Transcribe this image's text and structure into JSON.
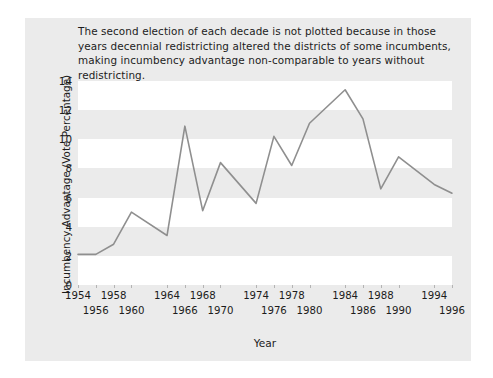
{
  "caption": "The second election of each decade is not plotted because in those years decennial redistricting altered the districts of some incumbents, making incumbency advantage non-comparable to years without redistricting.",
  "axis": {
    "ylabel": "Incumbency Advantage (Vote Percentage)",
    "xlabel": "Year"
  },
  "style": {
    "panel_background": "#ebebeb",
    "band_color": "#ffffff",
    "line_color": "#8f8f8f",
    "text_color": "#1c1c1c",
    "figure_background": "#ffffff"
  },
  "chart_data": {
    "type": "line",
    "title": "",
    "xlabel": "Year",
    "ylabel": "Incumbency Advantage (Vote Percentage)",
    "xlim": [
      1954,
      1996
    ],
    "ylim": [
      0,
      14
    ],
    "yticks": [
      0,
      2,
      4,
      6,
      8,
      10,
      12,
      14
    ],
    "xticks": [
      1954,
      1956,
      1958,
      1960,
      1964,
      1966,
      1968,
      1970,
      1974,
      1976,
      1978,
      1980,
      1984,
      1986,
      1988,
      1990,
      1994,
      1996
    ],
    "xticks_row0": [
      1954,
      1958,
      1964,
      1968,
      1974,
      1978,
      1984,
      1988,
      1994
    ],
    "xticks_row1": [
      1956,
      1960,
      1966,
      1970,
      1976,
      1980,
      1986,
      1990,
      1996
    ],
    "grid": "horizontal-bands",
    "legend": "none",
    "x": [
      1954,
      1956,
      1958,
      1960,
      1964,
      1966,
      1968,
      1970,
      1974,
      1976,
      1978,
      1980,
      1984,
      1986,
      1988,
      1990,
      1994,
      1996
    ],
    "y": [
      2.1,
      2.1,
      2.8,
      5.0,
      3.4,
      10.9,
      5.1,
      8.4,
      5.6,
      10.2,
      8.2,
      11.1,
      13.4,
      11.4,
      6.6,
      8.8,
      6.9,
      6.3
    ],
    "series": [
      {
        "name": "Incumbency advantage",
        "values": [
          2.1,
          2.1,
          2.8,
          5.0,
          3.4,
          10.9,
          5.1,
          8.4,
          5.6,
          10.2,
          8.2,
          11.1,
          13.4,
          11.4,
          6.6,
          8.8,
          6.9,
          6.3
        ]
      }
    ],
    "annotations": [
      "The second election of each decade is not plotted because in those years decennial redistricting altered the districts of some incumbents, making incumbency advantage non-comparable to years without redistricting."
    ]
  }
}
